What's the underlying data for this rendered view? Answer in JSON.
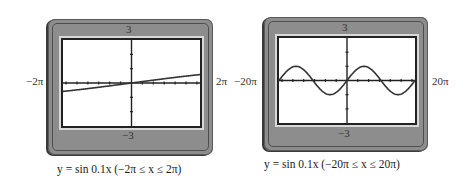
{
  "plots": [
    {
      "ymax_label": "3",
      "ymin_label": "−3",
      "xmin_label": "−2π",
      "xmax_label": "2π",
      "caption": "y = sin 0.1x (−2π ≤ x ≤ 2π)"
    },
    {
      "ymax_label": "3",
      "ymin_label": "−3",
      "xmin_label": "−20π",
      "xmax_label": "20π",
      "caption": "y = sin 0.1x (−20π ≤ x ≤ 20π)"
    }
  ],
  "chart_data": [
    {
      "type": "line",
      "title": "y = sin 0.1x (−2π ≤ x ≤ 2π)",
      "function": "y = sin(0.1x)",
      "xlabel": "",
      "ylabel": "",
      "xlim": [
        -6.2832,
        6.2832
      ],
      "ylim": [
        -3,
        3
      ],
      "x_tick_spacing": 1,
      "y_tick_spacing": 1,
      "x_tick_labels": [
        "−2π",
        "2π"
      ],
      "y_tick_labels": [
        "−3",
        "3"
      ],
      "grid": false,
      "x": [
        -6.2832,
        -4.7124,
        -3.1416,
        -1.5708,
        0,
        1.5708,
        3.1416,
        4.7124,
        6.2832
      ],
      "y": [
        -0.5878,
        -0.454,
        -0.309,
        -0.1564,
        0,
        0.1564,
        0.309,
        0.454,
        0.5878
      ]
    },
    {
      "type": "line",
      "title": "y = sin 0.1x (−20π ≤ x ≤ 20π)",
      "function": "y = sin(0.1x)",
      "xlabel": "",
      "ylabel": "",
      "xlim": [
        -62.832,
        62.832
      ],
      "ylim": [
        -3,
        3
      ],
      "x_tick_spacing": 10,
      "y_tick_spacing": 1,
      "x_tick_labels": [
        "−20π",
        "20π"
      ],
      "y_tick_labels": [
        "−3",
        "3"
      ],
      "grid": false,
      "x": [
        -62.832,
        -47.124,
        -31.416,
        -15.708,
        0,
        15.708,
        31.416,
        47.124,
        62.832
      ],
      "y": [
        0,
        1,
        0,
        -1,
        0,
        1,
        0,
        -1,
        0
      ]
    }
  ]
}
